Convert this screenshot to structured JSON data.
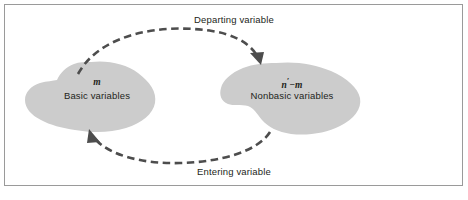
{
  "figure": {
    "width": 468,
    "height": 200,
    "background": "#ffffff",
    "border_color": "#9a9a9a"
  },
  "colors": {
    "blob_fill": "#cccccc",
    "arrow": "#4d4d4d",
    "text": "#231f20",
    "frame": "#9a9a9a"
  },
  "blobs": [
    {
      "name": "basic-variables-blob",
      "symbol": "m",
      "label": "Basic variables",
      "fill": "#cccccc"
    },
    {
      "name": "nonbasic-variables-blob",
      "symbol_base": "n",
      "symbol_prime": "′",
      "symbol_rest": "−m",
      "symbol_full": "n′−m",
      "label": "Nonbasic variables",
      "fill": "#cccccc"
    }
  ],
  "arrows": [
    {
      "name": "departing-variable-arrow",
      "label": "Departing variable",
      "direction": "left-to-right",
      "style": "dashed",
      "position": "top"
    },
    {
      "name": "entering-variable-arrow",
      "label": "Entering variable",
      "direction": "right-to-left",
      "style": "dashed",
      "position": "bottom"
    }
  ]
}
